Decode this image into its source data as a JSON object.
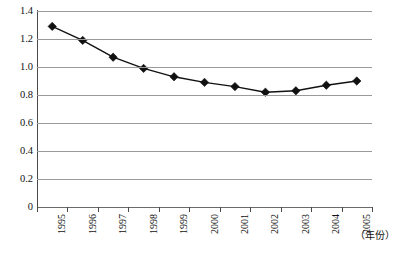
{
  "chart_data": {
    "type": "line",
    "title": "",
    "subtitle": "",
    "xlabel": "（年份）",
    "ylabel": "",
    "categories": [
      "1995",
      "1996",
      "1997",
      "1998",
      "1999",
      "2000",
      "2001",
      "2002",
      "2003",
      "2004",
      "2005"
    ],
    "series": [
      {
        "name": "series-1",
        "values": [
          1.29,
          1.19,
          1.07,
          0.99,
          0.93,
          0.89,
          0.86,
          0.82,
          0.83,
          0.87,
          0.9
        ]
      }
    ],
    "ylim": [
      0,
      1.4
    ],
    "ytick_labels": [
      "1.4",
      "1.2",
      "1.0",
      "0.8",
      "0.6",
      "0.4",
      "0.2",
      "0"
    ],
    "ytick_values": [
      1.4,
      1.2,
      1.0,
      0.8,
      0.6,
      0.4,
      0.2,
      0
    ],
    "grid": true,
    "grid_axis": "y",
    "legend": false,
    "legend_position": "none",
    "marker": "diamond",
    "line_color": "#111111",
    "marker_color": "#111111",
    "grid_color": "#9a9a9a",
    "axis_color": "#4a4a4a",
    "background": "#ffffff",
    "annotations": []
  }
}
